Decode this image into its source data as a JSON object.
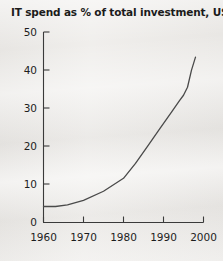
{
  "chart_data": {
    "type": "line",
    "title": "IT spend as % of total investment, US",
    "xlabel": "",
    "ylabel": "",
    "xlim": [
      1960,
      2000
    ],
    "ylim": [
      0,
      50
    ],
    "grid": false,
    "legend": null,
    "x_ticks": [
      1960,
      1970,
      1980,
      1990,
      2000
    ],
    "x_tick_labels": [
      "1960",
      "1970",
      "1980",
      "1990",
      "2000"
    ],
    "y_ticks": [
      0,
      10,
      20,
      30,
      40,
      50
    ],
    "y_tick_labels": [
      "0",
      "10",
      "20",
      "30",
      "40",
      "50"
    ],
    "series": [
      {
        "name": "IT spend as % of total investment, US",
        "color": "#4a4a4a",
        "x": [
          1960,
          1963,
          1966,
          1970,
          1975,
          1980,
          1983,
          1986,
          1989,
          1992,
          1994,
          1995,
          1996,
          1997,
          1998
        ],
        "values": [
          4.2,
          4.2,
          4.6,
          5.8,
          8.2,
          11.6,
          15.5,
          20.0,
          24.5,
          29.0,
          32.0,
          33.4,
          35.5,
          40.0,
          43.4
        ]
      }
    ]
  },
  "axis": {
    "y_axis_name": "percent-axis",
    "x_axis_name": "year-axis"
  }
}
